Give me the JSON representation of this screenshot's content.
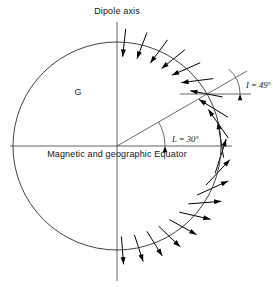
{
  "figure": {
    "title": "Dipole axis",
    "equator_label": "Magnetic and geographic Equator",
    "region_label": "G",
    "inclination_label": "I = 49°",
    "latitude_label": "L = 30°",
    "background_color": "#ffffff",
    "ink_color": "#1a1a1a"
  },
  "chart_data": {
    "type": "scatter",
    "title": "Dipole axis",
    "subtitle": "",
    "xlabel": "Magnetic and geographic Equator",
    "ylabel": "Dipole axis",
    "grid": false,
    "legend_position": "none",
    "annotations": [
      {
        "name": "dipole-axis",
        "text": "Dipole axis",
        "x": 117,
        "y": 14
      },
      {
        "name": "equator",
        "text": "Magnetic and geographic Equator",
        "x": 117,
        "y": 157
      },
      {
        "name": "globe-interior",
        "text": "G",
        "x": 78,
        "y": 95
      },
      {
        "name": "inclination",
        "text": "I = 49°",
        "x": 238,
        "y": 88
      },
      {
        "name": "latitude",
        "text": "L = 30°",
        "x": 163,
        "y": 139
      }
    ],
    "sphere": {
      "cx": 117,
      "cy": 146,
      "r": 104
    },
    "axis_vertical": {
      "x": 117,
      "y_top": 22,
      "y_bottom": 281
    },
    "axis_horizontal": {
      "y": 146,
      "x_left": 10,
      "x_right": 232
    },
    "latitude_ray": {
      "angle_deg": 30,
      "from_r": 0,
      "to_r": 150
    },
    "inclination_reference": {
      "through_latitude_point": true,
      "angle_deg": 0,
      "half_length": 44
    },
    "marked_angles": [
      {
        "name": "L",
        "value": 30,
        "unit": "deg"
      },
      {
        "name": "I",
        "value": 49,
        "unit": "deg"
      }
    ],
    "field_vectors_note": "Magnetic dipole field vectors sampled along the sphere surface; inclination I relates to latitude L by tan I = 2 tan L.",
    "field_vectors": [
      {
        "lat": 86,
        "len": 28
      },
      {
        "lat": 76,
        "len": 28
      },
      {
        "lat": 66,
        "len": 29
      },
      {
        "lat": 57,
        "len": 30
      },
      {
        "lat": 48,
        "len": 31
      },
      {
        "lat": 39,
        "len": 32
      },
      {
        "lat": 30,
        "len": 33
      },
      {
        "lat": 21,
        "len": 34
      },
      {
        "lat": 12,
        "len": 35
      },
      {
        "lat": 3,
        "len": 36
      },
      {
        "lat": -6,
        "len": 36
      },
      {
        "lat": -15,
        "len": 35
      },
      {
        "lat": -24,
        "len": 34
      },
      {
        "lat": -33,
        "len": 33
      },
      {
        "lat": -42,
        "len": 32
      },
      {
        "lat": -51,
        "len": 31
      },
      {
        "lat": -60,
        "len": 30
      },
      {
        "lat": -69,
        "len": 29
      },
      {
        "lat": -78,
        "len": 28
      },
      {
        "lat": -87,
        "len": 28
      }
    ]
  }
}
